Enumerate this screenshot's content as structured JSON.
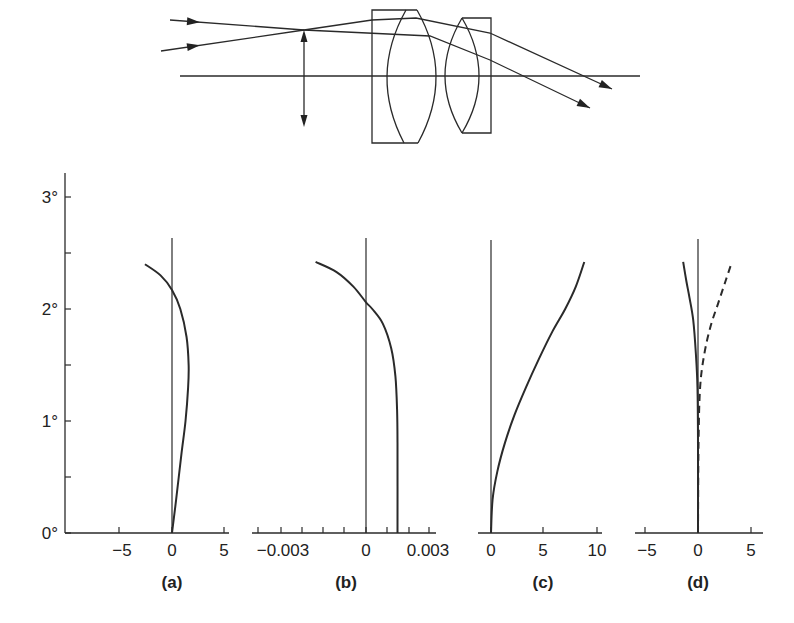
{
  "lens_diagram": {
    "optical_axis": {
      "x1": 180,
      "x2": 640,
      "y": 76
    },
    "aperture_stop": {
      "x": 304,
      "y_top": 30,
      "y_bottom": 127
    },
    "lens1": {
      "box_left": 372,
      "top": 10,
      "bottom": 143,
      "top_right": 417,
      "left_arc": {
        "top_x": 406,
        "bottom_x": 404,
        "bulge_x": 387
      },
      "right_arc": {
        "top_x": 417,
        "bottom_x": 418,
        "bulge_x": 436
      }
    },
    "lens2": {
      "top": 18,
      "bottom": 133,
      "lens_x": 462,
      "box_right": 491,
      "left_bulge_x": 445,
      "right_bulge_x": 479
    },
    "rays": [
      {
        "name": "ray-upper-incoming",
        "points": [
          [
            170,
            20
          ],
          [
            304,
            30
          ],
          [
            430,
            36
          ],
          [
            490,
            60
          ],
          [
            590,
            108
          ]
        ],
        "arrow_at": [
          200,
          22.2
        ]
      },
      {
        "name": "ray-lower-incoming",
        "points": [
          [
            161,
            51
          ],
          [
            304,
            30
          ],
          [
            372,
            20
          ],
          [
            416,
            18
          ],
          [
            490,
            33
          ],
          [
            612,
            89
          ]
        ],
        "arrow_at": [
          200,
          45.2
        ]
      }
    ]
  },
  "y_axis": {
    "labels": [
      "0°",
      "1°",
      "2°",
      "3°"
    ],
    "values": [
      0,
      1,
      2,
      3
    ],
    "minor_ticks": [
      0.5,
      1.5,
      2.5
    ]
  },
  "chart_data": [
    {
      "type": "line",
      "title": "(a)",
      "xlabel": "",
      "ylabel": "Field angle",
      "xlim": [
        -9.5,
        5.5
      ],
      "ylim": [
        0,
        3.2
      ],
      "x_ticks": [
        -5,
        0,
        5
      ],
      "x_tick_labels": [
        "−5",
        "0",
        "5"
      ],
      "series": [
        {
          "name": "curve-a",
          "style": "solid",
          "x": [
            0,
            0.4,
            0.9,
            1.3,
            1.55,
            1.6,
            1.4,
            0.8,
            0,
            -1.1,
            -2.6
          ],
          "y": [
            0,
            0.3,
            0.7,
            1.0,
            1.3,
            1.5,
            1.75,
            2.0,
            2.17,
            2.3,
            2.4
          ]
        }
      ]
    },
    {
      "type": "line",
      "title": "(b)",
      "xlabel": "",
      "ylabel": "",
      "xlim": [
        -0.0052,
        0.0032
      ],
      "ylim": [
        0,
        3.2
      ],
      "x_ticks": [
        -0.005,
        -0.004,
        -0.003,
        -0.002,
        -0.001,
        0,
        0.001,
        0.002,
        0.003
      ],
      "x_tick_labels": [
        "−0.003",
        "0",
        "0.003"
      ],
      "x_labeled_values": [
        -0.004,
        0,
        0.003
      ],
      "series": [
        {
          "name": "curve-b",
          "style": "solid",
          "x": [
            0.0015,
            0.0015,
            0.00148,
            0.0014,
            0.0012,
            0.0008,
            0.0003,
            0,
            -0.0006,
            -0.0014,
            -0.0024
          ],
          "y": [
            0,
            0.8,
            1.1,
            1.4,
            1.65,
            1.87,
            2.0,
            2.06,
            2.2,
            2.33,
            2.42
          ]
        }
      ]
    },
    {
      "type": "line",
      "title": "(c)",
      "xlabel": "",
      "ylabel": "",
      "xlim": [
        -2.5,
        10.5
      ],
      "ylim": [
        0,
        3.2
      ],
      "x_ticks": [
        0,
        5,
        10
      ],
      "x_tick_labels": [
        "0",
        "5",
        "10"
      ],
      "series": [
        {
          "name": "curve-c",
          "style": "solid",
          "x": [
            0,
            0.15,
            0.6,
            1.3,
            2.2,
            3.3,
            4.5,
            5.8,
            7.0,
            8.0,
            8.8
          ],
          "y": [
            0,
            0.3,
            0.55,
            0.8,
            1.05,
            1.3,
            1.55,
            1.8,
            2.0,
            2.2,
            2.42
          ]
        }
      ]
    },
    {
      "type": "line",
      "title": "(d)",
      "xlabel": "",
      "ylabel": "",
      "xlim": [
        -6,
        6.2
      ],
      "ylim": [
        0,
        3.2
      ],
      "x_ticks": [
        -5,
        0,
        5
      ],
      "x_tick_labels": [
        "−5",
        "0",
        "5"
      ],
      "series": [
        {
          "name": "curve-d-solid",
          "style": "solid",
          "x": [
            0,
            0,
            -0.05,
            -0.2,
            -0.45,
            -0.8,
            -1.1,
            -1.4
          ],
          "y": [
            0,
            0.8,
            1.3,
            1.6,
            1.9,
            2.1,
            2.25,
            2.42
          ]
        },
        {
          "name": "curve-d-dashed",
          "style": "dashed",
          "x": [
            0,
            0.05,
            0.2,
            0.6,
            1.2,
            1.9,
            2.6,
            3.2
          ],
          "y": [
            0,
            0.8,
            1.3,
            1.6,
            1.85,
            2.05,
            2.25,
            2.42
          ]
        }
      ]
    }
  ],
  "layout": {
    "y_axis_x": 65,
    "y_axis_top": 173,
    "baseline_y": 533,
    "px_per_degree": 112,
    "panels": [
      {
        "axis_x1": 65,
        "axis_x2": 229,
        "zero_x": 172,
        "px_per_unit": 10.4,
        "vline_top": 238,
        "label_x": 172,
        "ticks_px": [
          119,
          172,
          224
        ],
        "labels_px": [
          122,
          172,
          224
        ]
      },
      {
        "axis_x1": 252,
        "axis_x2": 436,
        "zero_x": 366,
        "px_per_unit": 21000,
        "vline_top": 238,
        "label_x": 346,
        "ticks_px": [
          258,
          281,
          302,
          323,
          344,
          366,
          387,
          409,
          429
        ],
        "labels_px": [
          283,
          366,
          428
        ]
      },
      {
        "axis_x1": 478,
        "axis_x2": 602,
        "zero_x": 491,
        "px_per_unit": 10.6,
        "vline_top": 240,
        "label_x": 543,
        "ticks_px": [
          491,
          543,
          597
        ],
        "labels_px": [
          491,
          543,
          597
        ]
      },
      {
        "axis_x1": 635,
        "axis_x2": 763,
        "zero_x": 698,
        "px_per_unit": 10.6,
        "vline_top": 239,
        "label_x": 698,
        "ticks_px": [
          645,
          698,
          751
        ],
        "labels_px": [
          647,
          698,
          751
        ]
      }
    ]
  }
}
